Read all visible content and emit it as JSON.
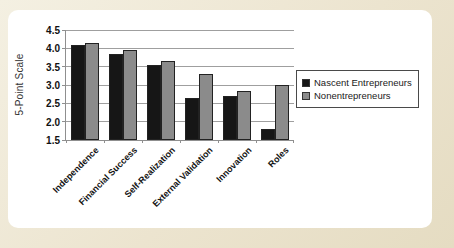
{
  "figure": {
    "background_color": "#ece4cf",
    "panel_color": "#ffffff"
  },
  "chart_data": {
    "type": "bar",
    "categories": [
      "Independence",
      "Financial Success",
      "Self-Realization",
      "External Validation",
      "Innovation",
      "Roles"
    ],
    "series": [
      {
        "name": "Nascent Entrepreneurs",
        "color": "#161616",
        "values": [
          4.1,
          3.85,
          3.55,
          2.65,
          2.7,
          1.8
        ]
      },
      {
        "name": "Nonentrepreneurs",
        "color": "#8b8b8b",
        "values": [
          4.15,
          3.95,
          3.65,
          3.3,
          2.85,
          3.0
        ]
      }
    ],
    "title": "",
    "xlabel": "",
    "ylabel": "5-Point Scale",
    "ylim": [
      1.5,
      4.5
    ],
    "ytick_step": 0.5,
    "yticks": [
      "4.5",
      "4.0",
      "3.5",
      "3.0",
      "2.5",
      "2.0",
      "1.5"
    ],
    "grid": true,
    "gridline_color": "#9f9f9f",
    "axis_color": "#8f8f8f",
    "legend_position": "middle-right",
    "bar_outline_color": "#222222"
  }
}
